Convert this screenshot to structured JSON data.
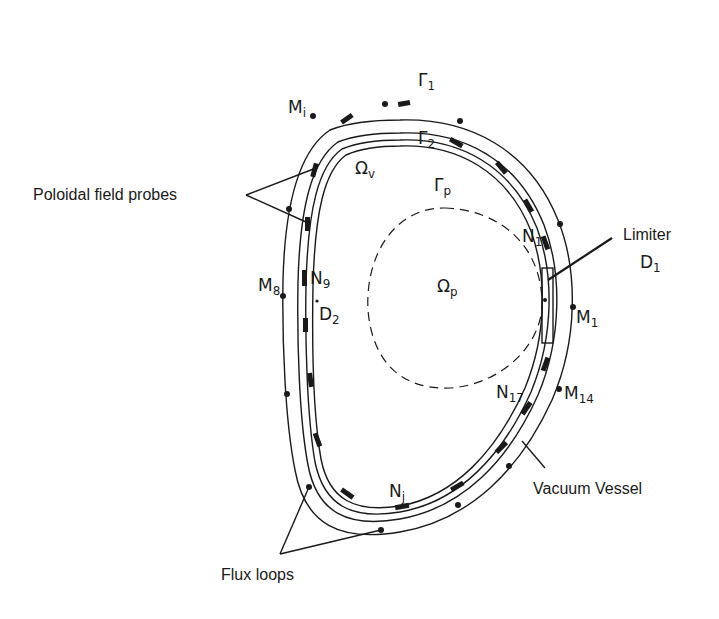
{
  "figure": {
    "type": "tokamak-cross-section",
    "annotations": {
      "poloidal_field_probes": "Poloidal field probes",
      "limiter": "Limiter",
      "limiter_id": "D",
      "limiter_sub": "1",
      "vacuum_vessel": "Vacuum Vessel",
      "flux_loops": "Flux loops"
    },
    "boundaries": {
      "gamma1": {
        "sym": "Γ",
        "sub": "1"
      },
      "gamma2": {
        "sym": "Γ",
        "sub": "2"
      },
      "gammap": {
        "sym": "Γ",
        "sub": "p"
      }
    },
    "regions": {
      "omega_v": {
        "sym": "Ω",
        "sub": "v"
      },
      "omega_p": {
        "sym": "Ω",
        "sub": "p"
      }
    },
    "flux_loop_labels": {
      "mi": {
        "sym": "M",
        "sub": "i"
      },
      "m8": {
        "sym": "M",
        "sub": "8"
      },
      "m1": {
        "sym": "M",
        "sub": "1"
      },
      "m14": {
        "sym": "M",
        "sub": "14"
      }
    },
    "probe_labels": {
      "n1": {
        "sym": "N",
        "sub": "1"
      },
      "n9": {
        "sym": "N",
        "sub": "9"
      },
      "n17": {
        "sym": "N",
        "sub": "17"
      },
      "nj": {
        "sym": "N",
        "sub": "j"
      }
    },
    "point_labels": {
      "d2": {
        "sym": "D",
        "sub": "2"
      }
    }
  }
}
